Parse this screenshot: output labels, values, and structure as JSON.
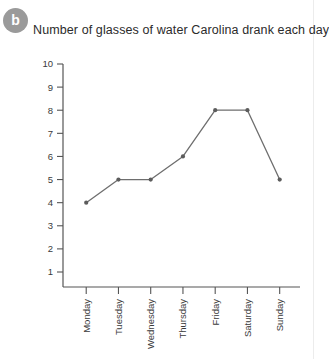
{
  "badge": {
    "label": "b"
  },
  "title": "Number of glasses of water Carolina drank each day.",
  "chart_data": {
    "type": "line",
    "title": "Number of glasses of water Carolina drank each day.",
    "xlabel": "",
    "ylabel": "",
    "categories": [
      "Monday",
      "Tuesday",
      "Wednesday",
      "Thursday",
      "Friday",
      "Saturday",
      "Sunday"
    ],
    "values": [
      4,
      5,
      5,
      6,
      8,
      8,
      5
    ],
    "ylim": [
      0,
      10
    ],
    "yticks": [
      10,
      9,
      8,
      7,
      6,
      5,
      4,
      3,
      2,
      1
    ],
    "grid": false,
    "legend": false,
    "series": [
      {
        "name": "Glasses of water",
        "values": [
          4,
          5,
          5,
          6,
          8,
          8,
          5
        ],
        "color": "#6e6e6e"
      }
    ],
    "points": [
      {
        "x": "Monday",
        "y": 4
      },
      {
        "x": "Tuesday",
        "y": 5
      },
      {
        "x": "Wednesday",
        "y": 5
      },
      {
        "x": "Thursday",
        "y": 6
      },
      {
        "x": "Friday",
        "y": 8
      },
      {
        "x": "Saturday",
        "y": 8
      },
      {
        "x": "Sunday",
        "y": 5
      }
    ]
  },
  "colors": {
    "line": "#6e6e6e",
    "marker": "#5c5c5c",
    "axis": "#555555",
    "badge_bg": "#9a9a9a",
    "text": "#2b2b2b"
  }
}
